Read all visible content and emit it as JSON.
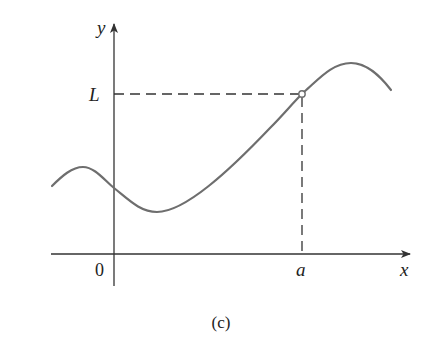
{
  "figure": {
    "caption": "(c)",
    "axes": {
      "x_label": "x",
      "y_label": "y",
      "origin_label": "0"
    },
    "annotations": {
      "limit_label": "L",
      "point_label": "a",
      "hole_at": "(a, L)",
      "hole_style": "open-circle"
    },
    "colors": {
      "curve": "#6e6e6e",
      "axis": "#333333",
      "dash": "#333333",
      "text": "#222222",
      "background": "#ffffff"
    }
  }
}
